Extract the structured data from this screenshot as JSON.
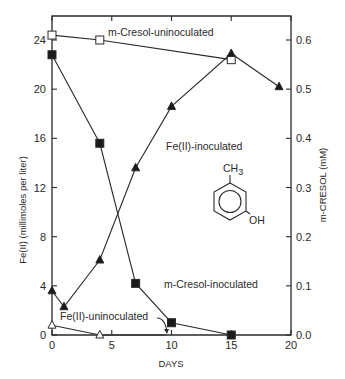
{
  "chart_data": {
    "type": "line",
    "title": "",
    "xlabel": "DAYS",
    "ylabel": "Fe(II) (millimoles per liter)",
    "y2label": "m-CRESOL (mM)",
    "xlim": [
      0,
      20
    ],
    "ylim": [
      0,
      26
    ],
    "y2lim": [
      0,
      0.65
    ],
    "xticks": [
      0,
      5,
      10,
      15,
      20
    ],
    "yticks": [
      0,
      4,
      8,
      12,
      16,
      20,
      24
    ],
    "y2ticks": [
      "0.0",
      "0.1",
      "0.2",
      "0.3",
      "0.4",
      "0.5",
      "0.6"
    ],
    "grid": false,
    "legend": "inline annotations",
    "series": [
      {
        "name": "m-Cresol-uninoculated",
        "axis": "right",
        "marker": "open-square",
        "x": [
          0,
          4,
          15
        ],
        "y_mM": [
          0.61,
          0.6,
          0.56
        ]
      },
      {
        "name": "m-Cresol-inoculated",
        "axis": "right",
        "marker": "filled-square",
        "x": [
          0,
          4,
          7,
          10,
          15
        ],
        "y_mM": [
          0.57,
          0.39,
          0.105,
          0.025,
          0.0
        ]
      },
      {
        "name": "Fe(II)-inoculated",
        "axis": "left",
        "marker": "filled-triangle",
        "x": [
          0,
          1,
          4,
          7,
          10,
          15,
          19
        ],
        "y": [
          3.6,
          2.3,
          6.1,
          13.6,
          18.6,
          22.9,
          20.2
        ]
      },
      {
        "name": "Fe(II)-uninoculated",
        "axis": "left",
        "marker": "open-triangle",
        "x": [
          0,
          4,
          9.5
        ],
        "y": [
          0.8,
          0.0,
          0.0
        ]
      }
    ],
    "annotations": [
      {
        "text": "m-Cresol-uninoculated",
        "x": 5.2,
        "y": 24.9
      },
      {
        "text": "Fe(II)-inoculated",
        "x": 10,
        "y": 14.7
      },
      {
        "text": "m-Cresol-inoculated",
        "x": 10.4,
        "y": 4.2
      },
      {
        "text": "Fe(II)-uninoculated",
        "x": 1.2,
        "y": 1.5
      },
      {
        "text": "CH3",
        "x": 14.6,
        "y": 11.8
      },
      {
        "text": "OH",
        "x": 16.2,
        "y": 7.3
      }
    ],
    "inset": "m-cresol structural formula (benzene ring with CH3 and OH)"
  },
  "labels": {
    "xlabel": "DAYS",
    "ylabel": "Fe(II) (millimoles per liter)",
    "y2label": "m-CRESOL (mM)",
    "ann_mcresol_uninoc": "m-Cresol-uninoculated",
    "ann_fe_inoc": "Fe(II)-inoculated",
    "ann_mcresol_inoc": "m-Cresol-inoculated",
    "ann_fe_uninoc": "Fe(II)-uninoculated",
    "ch3": "CH",
    "ch3_sub": "3",
    "oh": "OH"
  }
}
